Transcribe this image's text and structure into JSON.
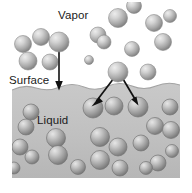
{
  "figure": {
    "width": 192,
    "height": 193,
    "background_color": "#ffffff"
  },
  "labels": {
    "vapor": "Vapor",
    "surface": "Surface",
    "liquid": "Liquid"
  },
  "regions": {
    "vapor": {
      "name": "vapor-region",
      "fill": "#ffffff",
      "bounds": {
        "x": 12,
        "y": 2,
        "width": 168,
        "height": 86
      }
    },
    "liquid": {
      "name": "liquid-region",
      "fill": "#c2c2c2",
      "bounds": {
        "x": 12,
        "y": 84,
        "width": 168,
        "height": 94
      }
    }
  },
  "colors": {
    "sphere_light": "#e2e2e2",
    "sphere_mid": "#b4b4b4",
    "sphere_dark": "#7d7d7d",
    "sphere_edge": "#6e6e6e",
    "liquid_fill": "#c2c2c2",
    "liquid_fill_dark": "#b0b0b0",
    "arrow": "#111111",
    "text": "#1a1a1a"
  },
  "arrows": [
    {
      "name": "evaporation-arrow-down-left",
      "from": {
        "x": 59,
        "y": 42
      },
      "to": {
        "x": 59,
        "y": 88
      },
      "direction": "down",
      "meaning": "molecule entering liquid at surface"
    },
    {
      "name": "condensation-arrow-left",
      "from": {
        "x": 118,
        "y": 73
      },
      "to": {
        "x": 93,
        "y": 107
      },
      "direction": "down-left",
      "meaning": "molecule condensing into liquid"
    },
    {
      "name": "condensation-arrow-right",
      "from": {
        "x": 120,
        "y": 74
      },
      "to": {
        "x": 137,
        "y": 106
      },
      "direction": "down-right",
      "meaning": "molecule condensing into liquid"
    }
  ],
  "vapor_molecules": [
    {
      "cx": 23,
      "cy": 44,
      "r": 8.5
    },
    {
      "cx": 41,
      "cy": 37,
      "r": 8.5
    },
    {
      "cx": 59,
      "cy": 42,
      "r": 10.0
    },
    {
      "cx": 28,
      "cy": 61,
      "r": 9.0
    },
    {
      "cx": 50,
      "cy": 62,
      "r": 8.0
    },
    {
      "cx": 98,
      "cy": 35,
      "r": 8.0
    },
    {
      "cx": 118,
      "cy": 18,
      "r": 9.5
    },
    {
      "cx": 104,
      "cy": 42,
      "r": 7.0
    },
    {
      "cx": 132,
      "cy": 49,
      "r": 7.5
    },
    {
      "cx": 154,
      "cy": 23,
      "r": 8.5
    },
    {
      "cx": 134,
      "cy": 6,
      "r": 7.5
    },
    {
      "cx": 163,
      "cy": 42,
      "r": 8.5
    },
    {
      "cx": 170,
      "cy": 16,
      "r": 6.5
    },
    {
      "cx": 118,
      "cy": 72,
      "r": 10.0
    },
    {
      "cx": 148,
      "cy": 72,
      "r": 8.0
    },
    {
      "cx": 89,
      "cy": 60,
      "r": 4.5
    }
  ],
  "liquid_molecules": [
    {
      "cx": 93,
      "cy": 108,
      "r": 10.0
    },
    {
      "cx": 114,
      "cy": 106,
      "r": 9.0
    },
    {
      "cx": 138,
      "cy": 107,
      "r": 10.0
    },
    {
      "cx": 31,
      "cy": 112,
      "r": 8.0
    },
    {
      "cx": 26,
      "cy": 127,
      "r": 8.0
    },
    {
      "cx": 20,
      "cy": 147,
      "r": 8.0
    },
    {
      "cx": 32,
      "cy": 157,
      "r": 7.0
    },
    {
      "cx": 56,
      "cy": 138,
      "r": 9.5
    },
    {
      "cx": 58,
      "cy": 155,
      "r": 9.5
    },
    {
      "cx": 78,
      "cy": 167,
      "r": 7.5
    },
    {
      "cx": 100,
      "cy": 137,
      "r": 9.5
    },
    {
      "cx": 100,
      "cy": 160,
      "r": 9.5
    },
    {
      "cx": 118,
      "cy": 147,
      "r": 9.0
    },
    {
      "cx": 120,
      "cy": 168,
      "r": 8.0
    },
    {
      "cx": 141,
      "cy": 143,
      "r": 8.0
    },
    {
      "cx": 155,
      "cy": 126,
      "r": 8.5
    },
    {
      "cx": 158,
      "cy": 163,
      "r": 8.0
    },
    {
      "cx": 170,
      "cy": 107,
      "r": 8.0
    },
    {
      "cx": 171,
      "cy": 130,
      "r": 8.5
    },
    {
      "cx": 172,
      "cy": 151,
      "r": 6.5
    },
    {
      "cx": 14,
      "cy": 168,
      "r": 6.0
    },
    {
      "cx": 146,
      "cy": 168,
      "r": 6.5
    }
  ],
  "surface_line": {
    "name": "liquid-surface-boundary",
    "path": "M 12 90 Q 24 84 36 88 Q 48 92 60 87 Q 72 82 84 87 Q 96 92 108 86 Q 120 81 132 86 Q 144 91 156 86 Q 168 81 180 85"
  }
}
